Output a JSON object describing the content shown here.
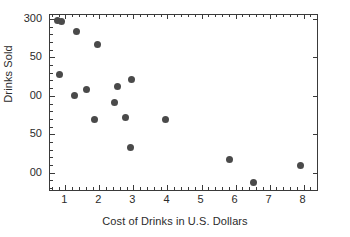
{
  "chart_data": {
    "type": "scatter",
    "title": "",
    "xlabel": "Cost of Drinks in U.S. Dollars",
    "ylabel": "Drinks Sold",
    "xlim": [
      0.55,
      8.45
    ],
    "ylim": [
      75,
      305
    ],
    "grid": false,
    "legend": null,
    "marker": {
      "shape": "circle",
      "color": "#4a4a4a",
      "size_px": 7
    },
    "xticks": [
      {
        "value": 1,
        "label": "1"
      },
      {
        "value": 2,
        "label": "2"
      },
      {
        "value": 3,
        "label": "3"
      },
      {
        "value": 4,
        "label": "4"
      },
      {
        "value": 5,
        "label": "5"
      },
      {
        "value": 6,
        "label": "6"
      },
      {
        "value": 7,
        "label": "7"
      },
      {
        "value": 8,
        "label": "8"
      }
    ],
    "x_minor_tick_step": 0.2,
    "yticks": [
      {
        "value": 300,
        "label": "300"
      },
      {
        "value": 250,
        "label": "50"
      },
      {
        "value": 200,
        "label": "00"
      },
      {
        "value": 150,
        "label": "50"
      },
      {
        "value": 100,
        "label": "00"
      }
    ],
    "ytick_note": "Leading digits of 250/200/150/100 are clipped at the left edge of the source image",
    "y_minor_tick_step": 10,
    "points": [
      {
        "x": 0.78,
        "y": 298
      },
      {
        "x": 0.88,
        "y": 296
      },
      {
        "x": 1.33,
        "y": 284
      },
      {
        "x": 1.95,
        "y": 267
      },
      {
        "x": 0.82,
        "y": 228
      },
      {
        "x": 1.27,
        "y": 200
      },
      {
        "x": 1.62,
        "y": 208
      },
      {
        "x": 1.85,
        "y": 169
      },
      {
        "x": 2.43,
        "y": 191
      },
      {
        "x": 2.52,
        "y": 212
      },
      {
        "x": 2.78,
        "y": 172
      },
      {
        "x": 2.92,
        "y": 133
      },
      {
        "x": 2.95,
        "y": 221
      },
      {
        "x": 3.94,
        "y": 169
      },
      {
        "x": 5.82,
        "y": 117
      },
      {
        "x": 6.52,
        "y": 87
      },
      {
        "x": 7.92,
        "y": 109
      }
    ]
  },
  "colors": {
    "marker": "#4a4a4a",
    "axis": "#3a3a3a",
    "text": "#2b2b2b",
    "background": "#ffffff"
  }
}
